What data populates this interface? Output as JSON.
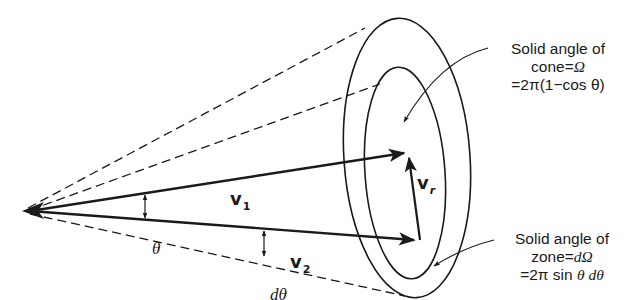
{
  "figure": {
    "colors": {
      "ink": "#1a1a1a",
      "background": "#ffffff"
    }
  },
  "vectors": {
    "v1": {
      "base": "v",
      "subscript": "1"
    },
    "v2": {
      "base": "v",
      "subscript": "2"
    },
    "vr": {
      "base": "v",
      "subscript": "r"
    }
  },
  "angles": {
    "theta": "θ",
    "dtheta": "dθ"
  },
  "annotations": {
    "cone": {
      "line1": "Solid angle of",
      "line2_text": "cone",
      "line2_eq": "=",
      "line2_sym": "Ω",
      "line3": "=2π(1−cos θ)"
    },
    "zone": {
      "line1": "Solid angle of",
      "line2_text": "zone",
      "line2_eq": "=",
      "line2_sym": "dΩ",
      "line3_pre": "=2π sin ",
      "line3_math": "θ dθ"
    }
  }
}
